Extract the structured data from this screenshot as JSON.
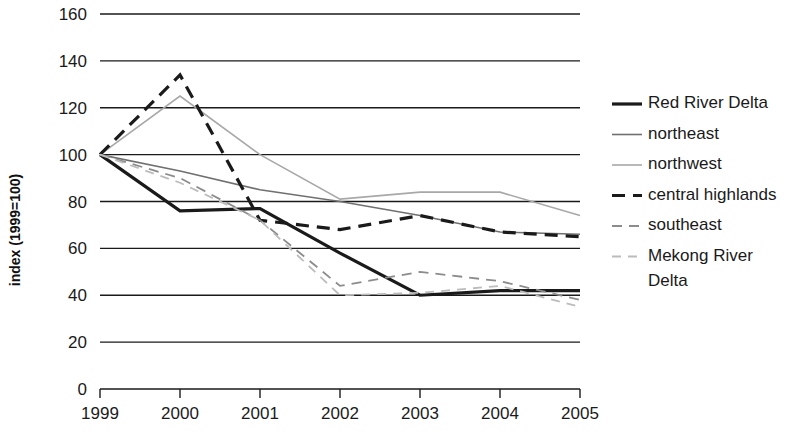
{
  "chart_data": {
    "type": "line",
    "title": "",
    "xlabel": "",
    "ylabel": "index (1999=100)",
    "x": [
      1999,
      2000,
      2001,
      2002,
      2003,
      2004,
      2005
    ],
    "categories": [
      "1999",
      "2000",
      "2001",
      "2002",
      "2003",
      "2004",
      "2005"
    ],
    "xtick_labels": [
      "1999",
      "2000",
      "2001",
      "2002",
      "2003",
      "2004",
      "2005"
    ],
    "ytick_labels": [
      "0",
      "20",
      "40",
      "60",
      "80",
      "100",
      "120",
      "140",
      "160"
    ],
    "yticks": [
      0,
      20,
      40,
      60,
      80,
      100,
      120,
      140,
      160
    ],
    "ylim": [
      0,
      160
    ],
    "grid": true,
    "grid_axis": "y",
    "legend_position": "right",
    "series": [
      {
        "name": "Red River Delta",
        "values": [
          100,
          76,
          77,
          58,
          40,
          42,
          42
        ],
        "color": "#1a1a1a",
        "style": "solid",
        "width": 3.2
      },
      {
        "name": "northeast",
        "values": [
          100,
          93,
          85,
          80,
          74,
          67,
          66
        ],
        "color": "#707070",
        "style": "solid",
        "width": 1.6
      },
      {
        "name": "northwest",
        "values": [
          100,
          125,
          100,
          81,
          84,
          84,
          74
        ],
        "color": "#a8a8a8",
        "style": "solid",
        "width": 1.6
      },
      {
        "name": "central highlands",
        "values": [
          100,
          134,
          72,
          68,
          74,
          67,
          65
        ],
        "color": "#1a1a1a",
        "style": "dashed",
        "width": 3.2,
        "dash": "13,8"
      },
      {
        "name": "southeast",
        "values": [
          100,
          90,
          72,
          44,
          50,
          46,
          38
        ],
        "color": "#8c8c8c",
        "style": "dashed",
        "width": 1.8,
        "dash": "10,7"
      },
      {
        "name": "Mekong River Delta",
        "values": [
          100,
          88,
          72,
          40,
          41,
          44,
          35
        ],
        "color": "#bcbcbc",
        "style": "dashed",
        "width": 1.8,
        "dash": "9,7"
      }
    ]
  },
  "legend": {
    "items": [
      {
        "label": "Red River Delta"
      },
      {
        "label": "northeast"
      },
      {
        "label": "northwest"
      },
      {
        "label": "central highlands"
      },
      {
        "label": "southeast"
      },
      {
        "label": "Mekong River"
      },
      {
        "label": "Delta"
      }
    ]
  },
  "axes": {
    "y_title": "index (1999=100)"
  }
}
